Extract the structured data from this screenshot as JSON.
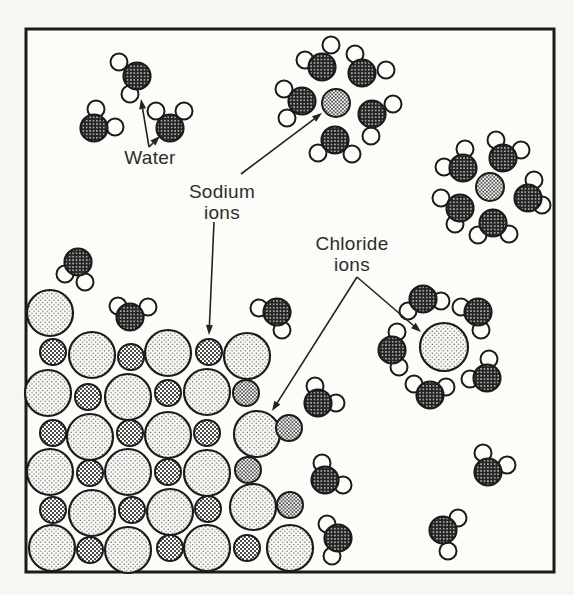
{
  "figure": {
    "width": 574,
    "height": 595,
    "background": "#f7f6f2",
    "frame": {
      "x": 26,
      "y": 29,
      "w": 528,
      "h": 543,
      "stroke_width": 3
    },
    "palette": {
      "ink": "#1b1b1b",
      "paper": "#fcfcf9",
      "label_text": "#2d2d2d",
      "oxygen_base": "#242424",
      "oxygen_dot": "#dcdcd8",
      "sodium_free_dot": "#3a3a3a",
      "sodium_lattice_square": "#4d4d4d",
      "chloride_dot": "#4f4f4f",
      "hydrogen_fill": "#fcfcf9",
      "arrow": "#222222"
    },
    "labels": {
      "water": {
        "line1": "Water",
        "x": 150,
        "y": 147
      },
      "sodium": {
        "line1": "Sodium",
        "line2": "ions",
        "x": 222,
        "y": 181
      },
      "chloride": {
        "line1": "Chloride",
        "line2": "ions",
        "x": 352,
        "y": 233
      }
    },
    "arrows": [
      {
        "x1": 149,
        "y1": 147,
        "x2": 141,
        "y2": 99
      },
      {
        "x1": 149,
        "y1": 147,
        "x2": 160,
        "y2": 136
      },
      {
        "x1": 241,
        "y1": 174,
        "x2": 322,
        "y2": 113
      },
      {
        "x1": 214,
        "y1": 222,
        "x2": 209,
        "y2": 335
      },
      {
        "x1": 357,
        "y1": 277,
        "x2": 272,
        "y2": 411
      },
      {
        "x1": 357,
        "y1": 277,
        "x2": 421,
        "y2": 332
      }
    ],
    "geometry": {
      "oxygen_r": 13.5,
      "hydrogen_r": 8.5
    },
    "water_molecules": [
      {
        "ox": 137,
        "oy": 76,
        "h": [
          [
            119,
            62
          ],
          [
            130,
            94
          ]
        ]
      },
      {
        "ox": 94,
        "oy": 128,
        "h": [
          [
            96,
            109
          ],
          [
            115,
            127
          ]
        ]
      },
      {
        "ox": 170,
        "oy": 128,
        "h": [
          [
            156,
            111
          ],
          [
            184,
            111
          ]
        ]
      },
      {
        "ox": 78,
        "oy": 262,
        "h": [
          [
            65,
            274
          ],
          [
            85,
            282
          ]
        ]
      },
      {
        "ox": 130,
        "oy": 317,
        "h": [
          [
            118,
            306
          ],
          [
            148,
            307
          ]
        ]
      },
      {
        "ox": 277,
        "oy": 312,
        "h": [
          [
            259,
            308
          ],
          [
            282,
            330
          ]
        ]
      },
      {
        "ox": 318,
        "oy": 403,
        "h": [
          [
            315,
            386
          ],
          [
            336,
            403
          ]
        ]
      },
      {
        "ox": 325,
        "oy": 480,
        "h": [
          [
            322,
            463
          ],
          [
            343,
            485
          ]
        ]
      },
      {
        "ox": 338,
        "oy": 538,
        "h": [
          [
            327,
            524
          ],
          [
            332,
            556
          ]
        ]
      },
      {
        "ox": 488,
        "oy": 472,
        "h": [
          [
            483,
            453
          ],
          [
            507,
            465
          ]
        ]
      },
      {
        "ox": 443,
        "oy": 530,
        "h": [
          [
            458,
            518
          ],
          [
            448,
            551
          ]
        ]
      },
      {
        "ox": 322,
        "oy": 67,
        "h": [
          [
            305,
            60
          ],
          [
            331,
            45
          ]
        ]
      },
      {
        "ox": 362,
        "oy": 73,
        "h": [
          [
            355,
            54
          ],
          [
            386,
            70
          ]
        ]
      },
      {
        "ox": 302,
        "oy": 101,
        "h": [
          [
            284,
            89
          ],
          [
            287,
            118
          ]
        ]
      },
      {
        "ox": 372,
        "oy": 114,
        "h": [
          [
            393,
            104
          ],
          [
            371,
            136
          ]
        ]
      },
      {
        "ox": 335,
        "oy": 140,
        "h": [
          [
            318,
            153
          ],
          [
            352,
            154
          ]
        ]
      },
      {
        "ox": 463,
        "oy": 168,
        "h": [
          [
            444,
            167
          ],
          [
            465,
            149
          ]
        ]
      },
      {
        "ox": 503,
        "oy": 158,
        "h": [
          [
            496,
            140
          ],
          [
            521,
            150
          ]
        ]
      },
      {
        "ox": 460,
        "oy": 208,
        "h": [
          [
            441,
            198
          ],
          [
            455,
            224
          ]
        ]
      },
      {
        "ox": 528,
        "oy": 198,
        "h": [
          [
            534,
            180
          ],
          [
            542,
            205
          ]
        ]
      },
      {
        "ox": 493,
        "oy": 223,
        "h": [
          [
            478,
            235
          ],
          [
            509,
            234
          ]
        ]
      },
      {
        "ox": 423,
        "oy": 299,
        "h": [
          [
            408,
            311
          ],
          [
            441,
            301
          ]
        ]
      },
      {
        "ox": 478,
        "oy": 312,
        "h": [
          [
            461,
            307
          ],
          [
            481,
            330
          ]
        ]
      },
      {
        "ox": 392,
        "oy": 350,
        "h": [
          [
            397,
            332
          ],
          [
            399,
            367
          ]
        ]
      },
      {
        "ox": 430,
        "oy": 395,
        "h": [
          [
            414,
            384
          ],
          [
            446,
            387
          ]
        ]
      },
      {
        "ox": 487,
        "oy": 378,
        "h": [
          [
            470,
            379
          ],
          [
            489,
            359
          ]
        ]
      }
    ],
    "sodium_ions": [
      {
        "cx": 336,
        "cy": 103,
        "r": 14,
        "variant": "free"
      },
      {
        "cx": 490,
        "cy": 187,
        "r": 14,
        "variant": "free"
      },
      {
        "cx": 246,
        "cy": 393,
        "r": 13,
        "variant": "free"
      },
      {
        "cx": 248,
        "cy": 470,
        "r": 13,
        "variant": "free"
      },
      {
        "cx": 289,
        "cy": 428,
        "r": 13,
        "variant": "free"
      },
      {
        "cx": 290,
        "cy": 505,
        "r": 13,
        "variant": "free"
      },
      {
        "cx": 53,
        "cy": 352,
        "r": 13,
        "variant": "lattice"
      },
      {
        "cx": 131,
        "cy": 357,
        "r": 13,
        "variant": "lattice"
      },
      {
        "cx": 209,
        "cy": 352,
        "r": 13,
        "variant": "lattice"
      },
      {
        "cx": 88,
        "cy": 397,
        "r": 13,
        "variant": "lattice"
      },
      {
        "cx": 168,
        "cy": 393,
        "r": 13,
        "variant": "lattice"
      },
      {
        "cx": 53,
        "cy": 433,
        "r": 13,
        "variant": "lattice"
      },
      {
        "cx": 130,
        "cy": 433,
        "r": 13,
        "variant": "lattice"
      },
      {
        "cx": 207,
        "cy": 433,
        "r": 13,
        "variant": "lattice"
      },
      {
        "cx": 90,
        "cy": 473,
        "r": 13,
        "variant": "lattice"
      },
      {
        "cx": 168,
        "cy": 472,
        "r": 13,
        "variant": "lattice"
      },
      {
        "cx": 53,
        "cy": 510,
        "r": 13,
        "variant": "lattice"
      },
      {
        "cx": 132,
        "cy": 510,
        "r": 13,
        "variant": "lattice"
      },
      {
        "cx": 208,
        "cy": 509,
        "r": 13,
        "variant": "lattice"
      },
      {
        "cx": 90,
        "cy": 550,
        "r": 13,
        "variant": "lattice"
      },
      {
        "cx": 170,
        "cy": 548,
        "r": 13,
        "variant": "lattice"
      },
      {
        "cx": 247,
        "cy": 548,
        "r": 13,
        "variant": "lattice"
      }
    ],
    "chloride_ions": [
      {
        "cx": 444,
        "cy": 347,
        "r": 24,
        "variant": "dissolved"
      },
      {
        "cx": 50,
        "cy": 313,
        "r": 23,
        "variant": "lattice"
      },
      {
        "cx": 92,
        "cy": 355,
        "r": 23,
        "variant": "lattice"
      },
      {
        "cx": 168,
        "cy": 353,
        "r": 23,
        "variant": "lattice"
      },
      {
        "cx": 247,
        "cy": 356,
        "r": 23,
        "variant": "lattice"
      },
      {
        "cx": 48,
        "cy": 393,
        "r": 23,
        "variant": "lattice"
      },
      {
        "cx": 128,
        "cy": 397,
        "r": 23,
        "variant": "lattice"
      },
      {
        "cx": 207,
        "cy": 392,
        "r": 23,
        "variant": "lattice"
      },
      {
        "cx": 90,
        "cy": 437,
        "r": 23,
        "variant": "lattice"
      },
      {
        "cx": 168,
        "cy": 435,
        "r": 23,
        "variant": "lattice"
      },
      {
        "cx": 257,
        "cy": 434,
        "r": 23,
        "variant": "lattice"
      },
      {
        "cx": 50,
        "cy": 472,
        "r": 23,
        "variant": "lattice"
      },
      {
        "cx": 128,
        "cy": 472,
        "r": 23,
        "variant": "lattice"
      },
      {
        "cx": 207,
        "cy": 473,
        "r": 23,
        "variant": "lattice"
      },
      {
        "cx": 92,
        "cy": 513,
        "r": 23,
        "variant": "lattice"
      },
      {
        "cx": 170,
        "cy": 512,
        "r": 23,
        "variant": "lattice"
      },
      {
        "cx": 253,
        "cy": 507,
        "r": 23,
        "variant": "lattice"
      },
      {
        "cx": 52,
        "cy": 548,
        "r": 23,
        "variant": "lattice"
      },
      {
        "cx": 128,
        "cy": 550,
        "r": 23,
        "variant": "lattice"
      },
      {
        "cx": 207,
        "cy": 548,
        "r": 23,
        "variant": "lattice"
      },
      {
        "cx": 290,
        "cy": 548,
        "r": 23,
        "variant": "lattice"
      }
    ]
  }
}
